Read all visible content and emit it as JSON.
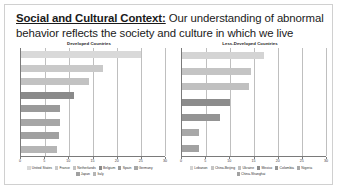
{
  "slide": {
    "headline_lead": "Social and Cultural Context:",
    "headline_rest": " Our understanding of abnormal behavior reflects the society and culture in which we live"
  },
  "chart_data": [
    {
      "type": "bar",
      "orientation": "horizontal",
      "title": "Developed Countries",
      "xlabel": "",
      "ylabel": "",
      "xlim": [
        0,
        30
      ],
      "xticks": [
        "0",
        "5",
        "10",
        "15",
        "20",
        "25",
        "30"
      ],
      "grid": true,
      "legend_position": "bottom",
      "categories": [
        "United States",
        "France",
        "Netherlands",
        "Belgium",
        "Spain",
        "Germany",
        "Japan",
        "Italy"
      ],
      "values": [
        25.0,
        17.0,
        14.2,
        11.0,
        8.2,
        8.2,
        8.0,
        7.5
      ],
      "colors": [
        "#d9d9d9",
        "#c9c9c9",
        "#c2c2c2",
        "#8a8a8a",
        "#9a9a9a",
        "#a6a6a6",
        "#a0a0a0",
        "#b5b5b5"
      ]
    },
    {
      "type": "bar",
      "orientation": "horizontal",
      "title": "Less-Developed Countries",
      "xlabel": "",
      "ylabel": "",
      "xlim": [
        0,
        30
      ],
      "xticks": [
        "0",
        "5",
        "10",
        "15",
        "20",
        "25",
        "30"
      ],
      "grid": true,
      "legend_position": "bottom",
      "categories": [
        "Lebanon",
        "China-Beijing",
        "Ukraine",
        "Mexico",
        "Colombia",
        "Nigeria",
        "China-Shanghai"
      ],
      "values": [
        17.0,
        14.3,
        14.0,
        10.0,
        8.0,
        3.5,
        3.5
      ],
      "colors": [
        "#d4d4d4",
        "#c4c4c4",
        "#c0c0c0",
        "#8c8c8c",
        "#949494",
        "#a8a8a8",
        "#a2a2a2"
      ]
    }
  ]
}
